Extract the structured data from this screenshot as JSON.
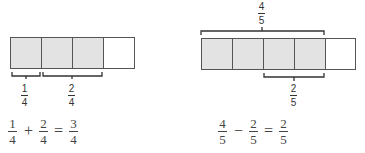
{
  "colors": {
    "shaded": "#e3e3e3",
    "unshaded": "#ffffff",
    "stroke": "#555555"
  },
  "left": {
    "model": {
      "parts": 4,
      "shaded": 3
    },
    "brace_1": {
      "num": "1",
      "den": "4"
    },
    "brace_2": {
      "num": "2",
      "den": "4"
    },
    "equation": {
      "a": {
        "num": "1",
        "den": "4"
      },
      "op": "+",
      "b": {
        "num": "2",
        "den": "4"
      },
      "eq": "=",
      "c": {
        "num": "3",
        "den": "4"
      }
    }
  },
  "right": {
    "model": {
      "parts": 5,
      "shaded": 4,
      "crossed_out": 2
    },
    "brace_top": {
      "num": "4",
      "den": "5"
    },
    "brace_bottom": {
      "num": "2",
      "den": "5"
    },
    "equation": {
      "a": {
        "num": "4",
        "den": "5"
      },
      "op": "−",
      "b": {
        "num": "2",
        "den": "5"
      },
      "eq": "=",
      "c": {
        "num": "2",
        "den": "5"
      }
    }
  }
}
